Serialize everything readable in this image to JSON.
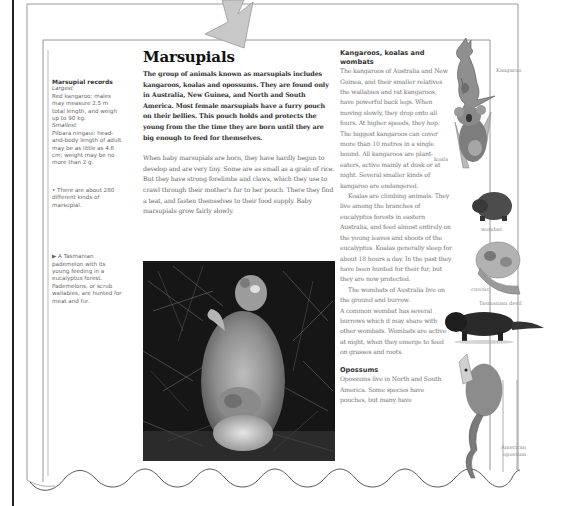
{
  "page": {
    "title": "Marsupials",
    "intro": "The group of animals known as marsupials includes kangaroos, koalas and opossums. They are found only in Australia, New Guinea, and North and South America. Most female marsupials have a furry pouch on their bellies. This pouch holds and protects the young from the the time they are born until they are big enough to feed for themselves.",
    "body": "When baby marsupials are born, they have hardly begun to develop and are very tiny. Some are as small as a grain of rice. But they have strong forelimbs and claws, which they use to crawl through their mother's fur to her pouch. There they find a teat, and fasten themselves to their food supply. Baby marsupials grow fairly slowly."
  },
  "sidebar": {
    "records_title": "Marsupial records",
    "largest_label": "Largest",
    "largest_text": "Red kangaroo: males may measure 2.5 m total length, and weigh up to 90 kg.",
    "smallest_label": "Smallest",
    "smallest_text": "Pilbara ningaui: head-and-body length of adult may be as little as 4.6 cm; weight may be no more than 2 g.",
    "note": "• There are about 280 different kinds of marsupial.",
    "caption": "▶ A Tasmanian pademelon with its young feeding in a eucalyptus forest. Pademelons, or scrub wallabies, are hunted for meat and fur."
  },
  "right_column": {
    "heading1": "Kangaroos, koalas and wombats",
    "para1": "The kangaroos of Australia and New Guinea, and their smaller relatives the wallabies and rat kangaroos, have powerful back legs. When moving slowly, they drop onto all fours. At higher speeds, they hop. The biggest kangaroos can cover more than 10 metres in a single bound. All kangaroos are plant-eaters, active mainly at dusk or at night. Several smaller kinds of kangaroo are endangered.",
    "para2": "Koalas are climbing animals. They live among the branches of eucalyptus forests in eastern Australia, and feed almost entirely on the young leaves and shoots of the eucalyptus. Koalas generally sleep for about 18 hours a day. In the past they have been hunted for their fur, but they are now protected.",
    "para3": "The wombats of Australia live on the ground and burrow.",
    "para4": "A common wombat has several burrows which it may share with other wombats. Wombats are active at night, when they emerge to feed on grasses and roots.",
    "heading2": "Opossums",
    "para5": "Opossums live in North and South America. Some species have pouches, but many have"
  },
  "illustrations": {
    "kangaroo": "Kangaroo",
    "koala": "koala",
    "wombat": "wombat",
    "cuscus": "cuscus",
    "tasmanian_devil": "Tasmanian devil",
    "american_opossum_1": "American",
    "american_opossum_2": "opossum"
  },
  "colors": {
    "arrow_fill": "#c8c8c8",
    "arrow_stroke": "#999999",
    "frame_line": "#888888",
    "outer_rule": "#222222"
  }
}
